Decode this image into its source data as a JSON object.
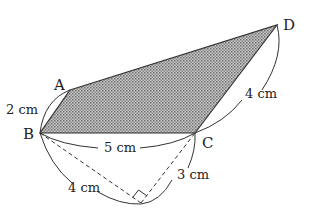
{
  "figure": {
    "shaded_region": "ABCD",
    "colors": {
      "stroke": "#333333",
      "shade": "#9a9a9a",
      "background": "#ffffff"
    }
  },
  "vertices": {
    "A": {
      "label": "A",
      "x": 70,
      "y": 90
    },
    "B": {
      "label": "B",
      "x": 40,
      "y": 133
    },
    "C": {
      "label": "C",
      "x": 195,
      "y": 133
    },
    "D": {
      "label": "D",
      "x": 277,
      "y": 25
    },
    "E": {
      "label": "",
      "x": 141,
      "y": 203
    }
  },
  "dimensions": {
    "AB": "2 cm",
    "BC": "5 cm",
    "CD": "4 cm",
    "BE": "4 cm",
    "EC": "3 cm"
  },
  "annotations": {
    "right_angle_at": "E",
    "dashed_segments": [
      "BE",
      "EC"
    ]
  }
}
